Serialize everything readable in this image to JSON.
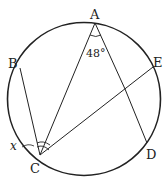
{
  "diagram": {
    "type": "circle-geometry",
    "points": {
      "A": {
        "label": "A",
        "x": 95,
        "y": 23
      },
      "B": {
        "label": "B",
        "x": 20,
        "y": 68
      },
      "C": {
        "label": "C",
        "x": 40,
        "y": 155
      },
      "D": {
        "label": "D",
        "x": 147,
        "y": 143
      },
      "E": {
        "label": "E",
        "x": 153,
        "y": 67
      }
    },
    "segments": [
      "AC",
      "AD",
      "BC",
      "CE"
    ],
    "angle_A": {
      "label": "48°",
      "between": [
        "AC",
        "AD"
      ]
    },
    "angle_C": {
      "label": "x",
      "between": [
        "CB",
        "CE"
      ]
    },
    "stroke_color": "#222222",
    "background": "#ffffff"
  }
}
